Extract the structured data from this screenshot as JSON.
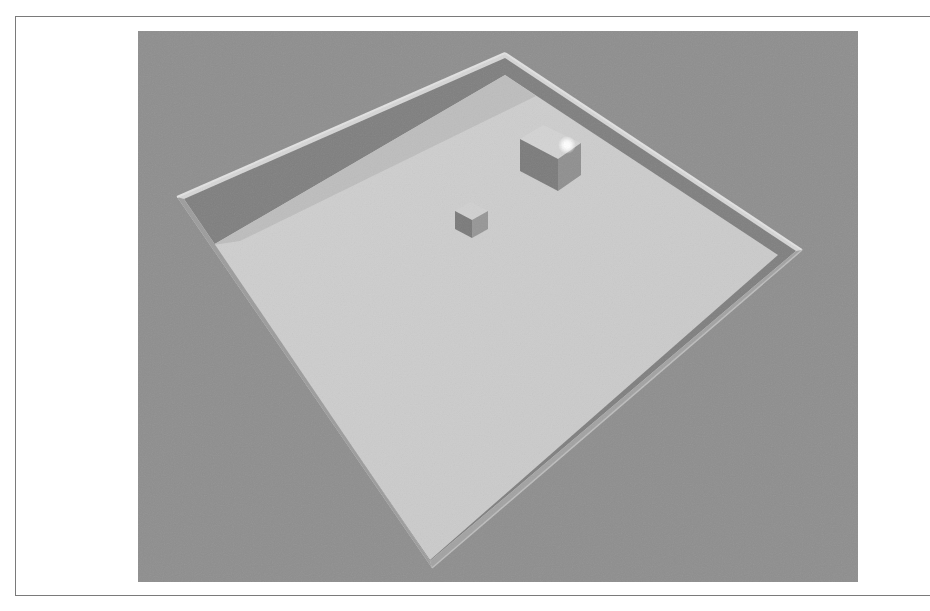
{
  "scene": {
    "type": "3d-render",
    "description": "Top-down perspective view of a walled square arena containing two cubes and a point light",
    "colors": {
      "background": "#8e8e8e",
      "floor": "#cdcdcd",
      "floor_shadow_band": "#b9b9b9",
      "wall_inner": "#7d7d7d",
      "wall_top": "#d9d9d9",
      "cube_top": "#d2d2d2",
      "cube_side_dark": "#7c7c7c",
      "cube_side_light": "#9a9a9a",
      "light": "#ffffff",
      "frame_border": "#7a7a7a"
    },
    "objects": [
      {
        "name": "arena-floor",
        "kind": "plane"
      },
      {
        "name": "arena-walls",
        "kind": "walls",
        "count": 4
      },
      {
        "name": "large-cube",
        "kind": "cube",
        "size": "large"
      },
      {
        "name": "small-cube",
        "kind": "cube",
        "size": "small"
      },
      {
        "name": "point-light",
        "kind": "light"
      }
    ]
  }
}
